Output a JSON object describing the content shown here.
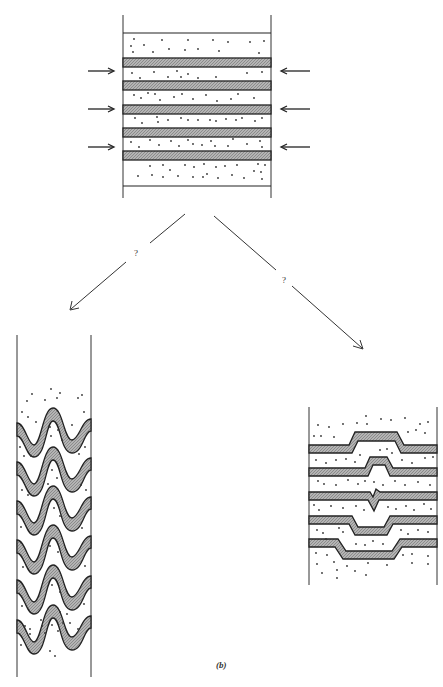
{
  "figure": {
    "caption": "(b)",
    "colors": {
      "line": "#222222",
      "band_fill": "#a8a8a8",
      "background": "#ffffff",
      "dot": "#333333"
    }
  },
  "top_block": {
    "description": "Horizontally layered sequence of stippled sandstone and competent shaded bands under lateral compression",
    "compression_arrows": 6,
    "bands": 5
  },
  "branches": [
    {
      "label": "?",
      "direction": "left",
      "outcome": "folded-layers"
    },
    {
      "label": "?",
      "direction": "right",
      "outcome": "boudinage-necking-layers"
    }
  ],
  "left_block": {
    "description": "Layers buckled into sinusoidal folds",
    "folded_bands": 6
  },
  "right_block": {
    "description": "Layers with flat-topped pinch and swell offsets",
    "bands": 5
  }
}
